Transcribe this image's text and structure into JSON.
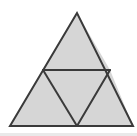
{
  "figure": {
    "shape_type": "geometric-diagram",
    "background_color": "#ffffff",
    "fill_color": "#d6d6d6",
    "stroke_color": "#3a3a3a",
    "stroke_width": 2,
    "scan_edge_color": "#e9e9e9",
    "outer_triangle": {
      "name": "outer-equilateral-triangle",
      "apex": {
        "x": 77,
        "y": 13
      },
      "bottom_left": {
        "x": 10,
        "y": 126
      },
      "bottom_right": {
        "x": 133,
        "y": 126
      },
      "points": "77,13 10,126 133,126"
    },
    "midpoints": {
      "left": {
        "x": 43,
        "y": 70
      },
      "right": {
        "x": 110,
        "y": 70
      },
      "bottom": {
        "x": 77,
        "y": 126
      }
    },
    "sub_triangles": [
      {
        "name": "top-triangle",
        "points": "77,13 43,70 110,70",
        "filled": true
      },
      {
        "name": "bottom-left-triangle",
        "points": "43,70 10,126 77,126",
        "filled": true
      },
      {
        "name": "bottom-right-triangle",
        "points": "110,70 77,126 133,126",
        "filled": true
      },
      {
        "name": "center-inverted-triangle",
        "points": "43,70 110,70 77,126",
        "filled": true
      }
    ],
    "interior_lines": [
      {
        "name": "horizontal-midsegment",
        "x1": 43,
        "y1": 70,
        "x2": 110,
        "y2": 70
      },
      {
        "name": "left-diagonal-midsegment",
        "x1": 43,
        "y1": 70,
        "x2": 77,
        "y2": 126
      },
      {
        "name": "right-diagonal-midsegment",
        "x1": 110,
        "y1": 70,
        "x2": 77,
        "y2": 126
      }
    ]
  }
}
